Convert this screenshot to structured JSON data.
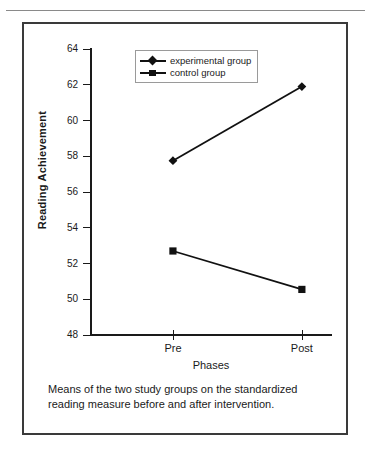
{
  "figure": {
    "caption_line_1": "Means of the two study groups on the standardized",
    "caption_line_2": "reading measure before and after intervention."
  },
  "legend": {
    "position": "top-center-inside",
    "entries": [
      {
        "label": "experimental group",
        "marker": "diamond-marker-icon",
        "color": "#111111"
      },
      {
        "label": "control group",
        "marker": "square-marker-icon",
        "color": "#111111"
      }
    ]
  },
  "chart_data": {
    "type": "line",
    "title": "",
    "subtitle": "",
    "xlabel": "Phases",
    "ylabel": "Reading Achievement",
    "categories": [
      "Pre",
      "Post"
    ],
    "x": [
      0,
      1
    ],
    "ylim": [
      48,
      64
    ],
    "yticks": [
      48,
      50,
      52,
      54,
      56,
      58,
      60,
      62,
      64
    ],
    "ytick_labels": [
      "48",
      "50",
      "52",
      "54",
      "56",
      "58",
      "60",
      "62",
      "64"
    ],
    "xtick_labels": [
      "Pre",
      "Post"
    ],
    "grid": false,
    "legend_position": "upper center",
    "series": [
      {
        "name": "experimental group",
        "marker": "diamond",
        "color": "#111111",
        "values": [
          57.75,
          61.9
        ]
      },
      {
        "name": "control group",
        "marker": "square",
        "color": "#111111",
        "values": [
          52.7,
          50.55
        ]
      }
    ]
  }
}
